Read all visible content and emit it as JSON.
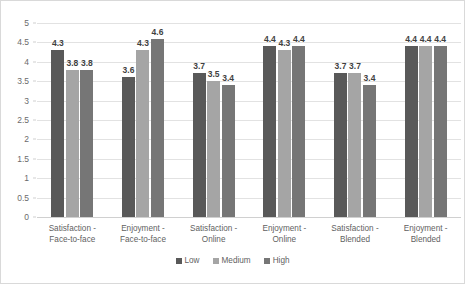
{
  "chart_data": {
    "type": "bar",
    "title": "",
    "subtitle": "",
    "xlabel": "",
    "ylabel": "",
    "ylim": [
      0,
      5
    ],
    "ytick_labels": [
      "5",
      "4.5",
      "4",
      "3.5",
      "3",
      "2.5",
      "2",
      "1.5",
      "1",
      "0.5",
      "0"
    ],
    "ytick_values": [
      5,
      4.5,
      4,
      3.5,
      3,
      2.5,
      2,
      1.5,
      1,
      0.5,
      0
    ],
    "grid": true,
    "legend_position": "bottom-center",
    "categories": [
      "Satisfaction -\nFace-to-face",
      "Enjoyment -\nFace-to-face",
      "Satisfaction -\nOnline",
      "Enjoyment -\nOnline",
      "Satisfaction -\nBlended",
      "Enjoyment -\nBlended"
    ],
    "series": [
      {
        "name": "Low",
        "color": "#595959",
        "values": [
          4.3,
          3.6,
          3.7,
          4.4,
          3.7,
          4.4
        ]
      },
      {
        "name": "Medium",
        "color": "#a5a5a5",
        "values": [
          3.8,
          4.3,
          3.5,
          4.3,
          3.7,
          4.4
        ]
      },
      {
        "name": "High",
        "color": "#767676",
        "values": [
          3.8,
          4.6,
          3.4,
          4.4,
          3.4,
          4.4
        ]
      }
    ],
    "data_labels": [
      [
        "4.3",
        "3.8",
        "3.8"
      ],
      [
        "3.6",
        "4.3",
        "4.6"
      ],
      [
        "3.7",
        "3.5",
        "3.4"
      ],
      [
        "4.4",
        "4.3",
        "4.4"
      ],
      [
        "3.7",
        "3.7",
        "3.4"
      ],
      [
        "4.4",
        "4.4",
        "4.4"
      ]
    ]
  }
}
